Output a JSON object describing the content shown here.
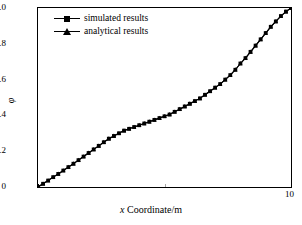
{
  "chart_data": {
    "type": "line",
    "title": "",
    "xlabel": "x Coordinate/m",
    "ylabel": "φ",
    "xlim": [
      0,
      10
    ],
    "ylim": [
      0,
      1.0
    ],
    "xticks": [
      0,
      5,
      10
    ],
    "xtick_labels": [
      "",
      "",
      "10"
    ],
    "yticks": [
      0,
      0.2,
      0.4,
      0.6,
      0.8,
      1.0
    ],
    "ytick_labels": [
      "0",
      "0.2",
      "0.4",
      "0.6",
      "0.8",
      "1.0"
    ],
    "grid": false,
    "legend_position": "upper-left",
    "series": [
      {
        "name": "simulated results",
        "marker": "square",
        "color": "#000000",
        "x": [
          0.0,
          0.2,
          0.4,
          0.6,
          0.8,
          1.0,
          1.2,
          1.4,
          1.6,
          1.8,
          2.0,
          2.2,
          2.4,
          2.6,
          2.8,
          3.0,
          3.2,
          3.4,
          3.6,
          3.8,
          4.0,
          4.2,
          4.4,
          4.6,
          4.8,
          5.0,
          5.2,
          5.4,
          5.6,
          5.8,
          6.0,
          6.2,
          6.4,
          6.6,
          6.8,
          7.0,
          7.2,
          7.4,
          7.6,
          7.8,
          8.0,
          8.2,
          8.4,
          8.6,
          8.8,
          9.0,
          9.2,
          9.4,
          9.6,
          9.8,
          10.0
        ],
        "y": [
          0.0,
          0.018,
          0.036,
          0.055,
          0.073,
          0.092,
          0.111,
          0.13,
          0.15,
          0.17,
          0.19,
          0.21,
          0.23,
          0.25,
          0.27,
          0.285,
          0.3,
          0.315,
          0.325,
          0.335,
          0.345,
          0.355,
          0.365,
          0.375,
          0.385,
          0.395,
          0.405,
          0.42,
          0.435,
          0.45,
          0.465,
          0.48,
          0.495,
          0.515,
          0.535,
          0.555,
          0.575,
          0.6,
          0.625,
          0.655,
          0.69,
          0.72,
          0.755,
          0.79,
          0.825,
          0.86,
          0.895,
          0.925,
          0.955,
          0.98,
          1.0
        ]
      },
      {
        "name": "analytical results",
        "marker": "triangle",
        "color": "#000000",
        "x": [
          0.0,
          0.2,
          0.4,
          0.6,
          0.8,
          1.0,
          1.2,
          1.4,
          1.6,
          1.8,
          2.0,
          2.2,
          2.4,
          2.6,
          2.8,
          3.0,
          3.2,
          3.4,
          3.6,
          3.8,
          4.0,
          4.2,
          4.4,
          4.6,
          4.8,
          5.0,
          5.2,
          5.4,
          5.6,
          5.8,
          6.0,
          6.2,
          6.4,
          6.6,
          6.8,
          7.0,
          7.2,
          7.4,
          7.6,
          7.8,
          8.0,
          8.2,
          8.4,
          8.6,
          8.8,
          9.0,
          9.2,
          9.4,
          9.6,
          9.8,
          10.0
        ],
        "y": [
          0.0,
          0.018,
          0.036,
          0.055,
          0.073,
          0.092,
          0.111,
          0.13,
          0.15,
          0.17,
          0.19,
          0.21,
          0.23,
          0.25,
          0.27,
          0.285,
          0.3,
          0.315,
          0.325,
          0.335,
          0.345,
          0.355,
          0.365,
          0.375,
          0.385,
          0.395,
          0.405,
          0.42,
          0.435,
          0.45,
          0.465,
          0.48,
          0.495,
          0.515,
          0.535,
          0.555,
          0.575,
          0.6,
          0.625,
          0.655,
          0.69,
          0.72,
          0.755,
          0.79,
          0.825,
          0.86,
          0.895,
          0.925,
          0.955,
          0.98,
          1.0
        ]
      }
    ]
  },
  "legend": {
    "entries": [
      {
        "label": "simulated results",
        "marker": "square-marker"
      },
      {
        "label": "analytical results",
        "marker": "triangle-marker"
      }
    ]
  },
  "axes": {
    "x_axis_label": "x Coordinate/m",
    "x_axis_label_italic_prefix": "x",
    "x_axis_label_rest": " Coordinate/m",
    "y_axis_label": "φ"
  }
}
